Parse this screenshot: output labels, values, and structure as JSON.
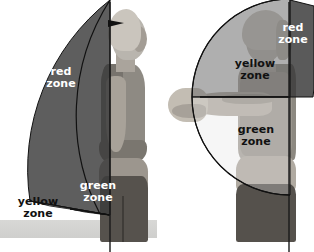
{
  "figure": {
    "width": 314,
    "height": 252
  },
  "colors": {
    "red_zone": "#3a3a3a",
    "yellow_zone": "#6e6e6e",
    "green_zone": "#c9c9c9",
    "label_light": "#ffffff",
    "label_dark": "#111111",
    "stroke": "#111111",
    "background": "#ffffff",
    "floor": "#d4d4d2"
  },
  "panels": [
    {
      "name": "side-view",
      "position": "left",
      "pivot": {
        "x": 110,
        "y": 215
      },
      "axis": {
        "type": "vertical-line",
        "x": 110,
        "y_top": 2,
        "y_bottom": 252
      },
      "arrow": {
        "x": 116,
        "y": 22,
        "direction": "right"
      },
      "zones": [
        {
          "id": "red",
          "label_line1": "red",
          "label_line2": "zone",
          "label_color": "#ffffff",
          "fill": "#3a3a3a",
          "angle_from_deg": 0,
          "angle_to_deg": 68,
          "radius": 215
        },
        {
          "id": "yellow",
          "label_line1": "yellow",
          "label_line2": "zone",
          "label_color": "#111111",
          "fill": "#6e6e6e",
          "angle_from_deg": 68,
          "angle_to_deg": 80,
          "radius": 215
        },
        {
          "id": "green",
          "label_line1": "green",
          "label_line2": "zone",
          "label_color": "#ffffff",
          "fill": "#c9c9c9",
          "angle_from_deg": 80,
          "angle_to_deg": 90,
          "radius": 215
        }
      ]
    },
    {
      "name": "front-view",
      "position": "right",
      "pivot": {
        "x": 290,
        "y": 97
      },
      "axis": {
        "type": "vertical-line",
        "x": 289,
        "y_top": 2,
        "y_bottom": 252
      },
      "baseline": {
        "type": "horizontal-line",
        "y": 105,
        "x_from": 200,
        "x_to": 290
      },
      "zones": [
        {
          "id": "yellow",
          "label_line1": "yellow",
          "label_line2": "zone",
          "label_color": "#111111",
          "fill": "#6e6e6e",
          "sector": "upper-left",
          "radius": 98
        },
        {
          "id": "red",
          "label_line1": "red",
          "label_line2": "zone",
          "label_color": "#ffffff",
          "fill": "#3a3a3a",
          "sector": "upper-right",
          "radius": 98
        },
        {
          "id": "green",
          "label_line1": "green",
          "label_line2": "zone",
          "label_color": "#111111",
          "fill": "#c9c9c9",
          "sector": "lower-left",
          "radius": 98
        }
      ]
    }
  ]
}
